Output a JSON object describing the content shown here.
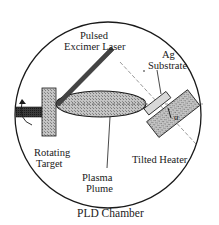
{
  "diagram": {
    "title": "PLD Chamber",
    "labels": {
      "laser_line1": "Pulsed",
      "laser_line2": "Excimer Laser",
      "substrate_line1": "Ag",
      "substrate_line2": "Substrate",
      "target_line1": "Rotating",
      "target_line2": "Target",
      "plume_line1": "Plasma",
      "plume_line2": "Plume",
      "heater": "Tilted Heater",
      "angle": "α"
    },
    "components": [
      "chamber",
      "pulsed-excimer-laser",
      "rotating-target",
      "plasma-plume",
      "ag-substrate",
      "tilted-heater",
      "tilt-angle"
    ],
    "colors": {
      "outline": "#1a1a1a",
      "fill_gray": "#b8b8b8",
      "fill_dark": "#333333",
      "background": "#ffffff"
    }
  }
}
